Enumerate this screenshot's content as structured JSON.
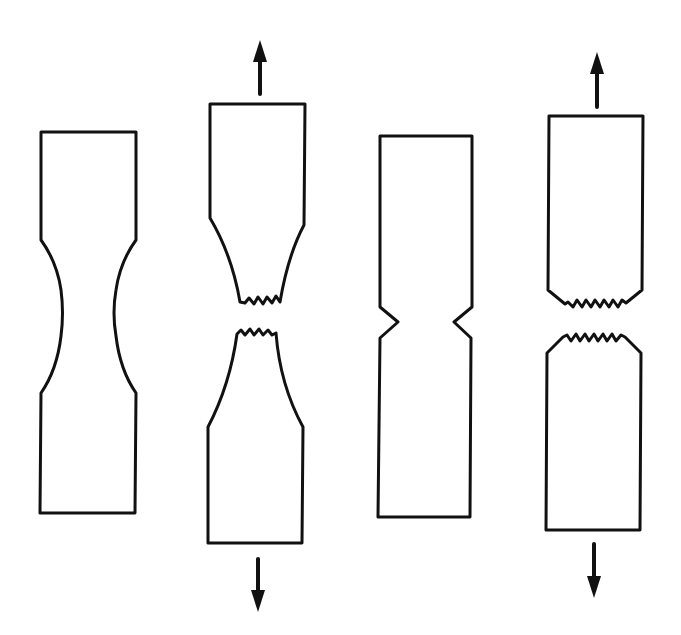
{
  "figure": {
    "description": "Tensile test specimens: ductile (necking) vs. notched (brittle) fracture",
    "colors": {
      "stroke": "#111111",
      "background": "#ffffff"
    },
    "specimens": [
      {
        "id": "unnotched-before",
        "label": "Smooth specimen with reduced (curved) gauge section",
        "state": "intact"
      },
      {
        "id": "unnotched-after",
        "label": "Smooth specimen fractured after necking (cup-and-cone)",
        "state": "fractured",
        "load_arrows": [
          "up",
          "down"
        ]
      },
      {
        "id": "notched-before",
        "label": "V-notched specimen",
        "state": "intact"
      },
      {
        "id": "notched-after",
        "label": "Notched specimen fractured with little contraction",
        "state": "fractured",
        "load_arrows": [
          "up",
          "down"
        ]
      }
    ],
    "arrows": [
      {
        "id": "arrow-1-up",
        "direction": "up",
        "icon": "arrow-up-icon"
      },
      {
        "id": "arrow-1-down",
        "direction": "down",
        "icon": "arrow-down-icon"
      },
      {
        "id": "arrow-2-up",
        "direction": "up",
        "icon": "arrow-up-icon"
      },
      {
        "id": "arrow-2-down",
        "direction": "down",
        "icon": "arrow-down-icon"
      }
    ]
  }
}
